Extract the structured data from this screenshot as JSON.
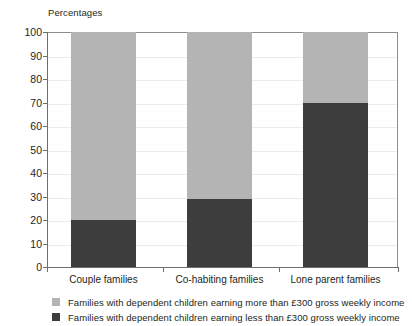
{
  "chart_data": {
    "type": "bar",
    "subtype": "stacked-bar-100",
    "title": "",
    "ylabel": "Percentages",
    "xlabel": "",
    "ylim": [
      0,
      100
    ],
    "ytick_step": 10,
    "yticks": [
      0,
      10,
      20,
      30,
      40,
      50,
      60,
      70,
      80,
      90,
      100
    ],
    "ytick_labels": [
      "0",
      "10",
      "20",
      "30",
      "40",
      "50",
      "60",
      "70",
      "80",
      "90",
      "100"
    ],
    "grid": true,
    "legend_position": "bottom-left",
    "categories": [
      "Couple families",
      "Co-habiting families",
      "Lone parent families"
    ],
    "series": [
      {
        "name": "Families with dependent children earning more than £300 gross weekly income",
        "color": "#b4b4b4",
        "values": [
          80,
          71,
          30
        ]
      },
      {
        "name": "Families with dependent children earning less than £300 gross weekly income",
        "color": "#3d3d3d",
        "values": [
          20,
          29,
          70
        ]
      }
    ]
  },
  "axis_title": "Percentages",
  "legend": {
    "items": [
      {
        "label": "Families with dependent children earning more than £300 gross weekly income",
        "color": "#b4b4b4"
      },
      {
        "label": "Families with dependent children earning less than £300 gross weekly income",
        "color": "#3d3d3d"
      }
    ]
  },
  "colors": {
    "light_series": "#b4b4b4",
    "dark_series": "#3d3d3d",
    "axis": "#6e6e6e",
    "gridline": "#eceaea",
    "text": "#231f20",
    "background": "#ffffff"
  }
}
